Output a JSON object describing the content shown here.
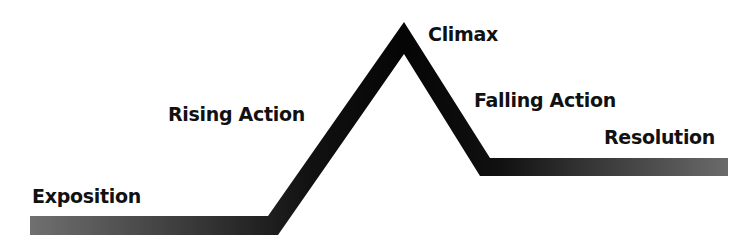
{
  "diagram": {
    "type": "plot-structure-arc",
    "stages": [
      {
        "id": "exposition",
        "label": "Exposition"
      },
      {
        "id": "rising-action",
        "label": "Rising Action"
      },
      {
        "id": "climax",
        "label": "Climax"
      },
      {
        "id": "falling-action",
        "label": "Falling Action"
      },
      {
        "id": "resolution",
        "label": "Resolution"
      }
    ],
    "colors": {
      "line_dark": "#0a0a0a",
      "line_light": "#6e6e6e",
      "text": "#111111",
      "background": "#ffffff"
    }
  }
}
